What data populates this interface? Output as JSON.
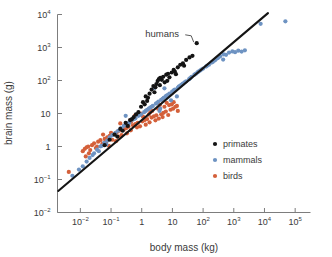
{
  "chart_data": {
    "type": "scatter",
    "title": "",
    "xlabel": "body mass (kg)",
    "ylabel": "brain mass (g)",
    "xscale": "log",
    "yscale": "log",
    "xlim": [
      0.0018,
      316000
    ],
    "ylim": [
      0.01,
      10000
    ],
    "grid": false,
    "legend_position": "inside-lower-right",
    "xticks": [
      {
        "value": 0.01,
        "label": "10",
        "exp": "−2"
      },
      {
        "value": 0.1,
        "label": "10",
        "exp": "−1"
      },
      {
        "value": 1,
        "label": "1",
        "exp": ""
      },
      {
        "value": 10,
        "label": "10",
        "exp": ""
      },
      {
        "value": 100,
        "label": "10",
        "exp": "2"
      },
      {
        "value": 1000,
        "label": "10",
        "exp": "3"
      },
      {
        "value": 10000,
        "label": "10",
        "exp": "4"
      },
      {
        "value": 100000,
        "label": "10",
        "exp": "5"
      }
    ],
    "yticks": [
      {
        "value": 10000,
        "label": "10",
        "exp": "4"
      },
      {
        "value": 1000,
        "label": "10",
        "exp": "3"
      },
      {
        "value": 100,
        "label": "10",
        "exp": "2"
      },
      {
        "value": 10,
        "label": "10",
        "exp": ""
      },
      {
        "value": 1,
        "label": "1",
        "exp": ""
      },
      {
        "value": 0.1,
        "label": "10",
        "exp": "−1"
      },
      {
        "value": 0.01,
        "label": "10",
        "exp": "−2"
      }
    ],
    "annotations": [
      {
        "text": "humans",
        "target_x": 62,
        "target_y": 1350,
        "label_x": 1.3,
        "label_y": 2600
      }
    ],
    "trend_line": {
      "x0": 0.0019,
      "y0": 0.045,
      "x1": 13000,
      "y1": 11000,
      "color": "#141414"
    },
    "series": [
      {
        "name": "primates",
        "color": "#141414",
        "marker": "circle",
        "size": 2.1,
        "points": [
          [
            0.062,
            1.1
          ],
          [
            0.09,
            1.6
          ],
          [
            0.13,
            2.3
          ],
          [
            0.2,
            3.4
          ],
          [
            0.3,
            5.2
          ],
          [
            0.42,
            6.3
          ],
          [
            0.55,
            7.8
          ],
          [
            0.78,
            11
          ],
          [
            0.95,
            16
          ],
          [
            1.1,
            22
          ],
          [
            1.35,
            33
          ],
          [
            1.5,
            24
          ],
          [
            1.8,
            40
          ],
          [
            2.1,
            53
          ],
          [
            2.4,
            68
          ],
          [
            2.6,
            44
          ],
          [
            3.0,
            78
          ],
          [
            3.3,
            96
          ],
          [
            3.6,
            110
          ],
          [
            4.0,
            120
          ],
          [
            4.5,
            105
          ],
          [
            5.0,
            130
          ],
          [
            5.6,
            88
          ],
          [
            6.3,
            150
          ],
          [
            7.2,
            160
          ],
          [
            8.0,
            125
          ],
          [
            9.5,
            175
          ],
          [
            11,
            210
          ],
          [
            13,
            155
          ],
          [
            15,
            250
          ],
          [
            18,
            300
          ],
          [
            22,
            330
          ],
          [
            28,
            420
          ],
          [
            36,
            500
          ],
          [
            45,
            560
          ],
          [
            62,
            1350
          ],
          [
            0.35,
            4.2
          ],
          [
            0.65,
            9.4
          ],
          [
            2.8,
            62
          ],
          [
            6.8,
            98
          ],
          [
            1.25,
            19
          ],
          [
            3.9,
            72
          ],
          [
            12,
            185
          ],
          [
            24,
            280
          ],
          [
            0.16,
            2.0
          ],
          [
            0.24,
            3.0
          ],
          [
            0.48,
            6.8
          ],
          [
            1.6,
            30
          ]
        ]
      },
      {
        "name": "mammals",
        "color": "#6e93c2",
        "marker": "circle",
        "size": 2.1,
        "points": [
          [
            0.0055,
            0.13
          ],
          [
            0.009,
            0.2
          ],
          [
            0.012,
            0.25
          ],
          [
            0.016,
            0.35
          ],
          [
            0.02,
            0.45
          ],
          [
            0.028,
            0.62
          ],
          [
            0.035,
            0.8
          ],
          [
            0.045,
            1.0
          ],
          [
            0.06,
            1.3
          ],
          [
            0.075,
            1.5
          ],
          [
            0.09,
            1.9
          ],
          [
            0.11,
            2.2
          ],
          [
            0.14,
            2.6
          ],
          [
            0.17,
            3.0
          ],
          [
            0.21,
            3.6
          ],
          [
            0.26,
            4.2
          ],
          [
            0.32,
            4.8
          ],
          [
            0.4,
            5.5
          ],
          [
            0.5,
            6.5
          ],
          [
            0.62,
            7.2
          ],
          [
            0.78,
            8.5
          ],
          [
            0.95,
            9.5
          ],
          [
            1.2,
            11
          ],
          [
            1.5,
            13
          ],
          [
            1.9,
            15
          ],
          [
            2.3,
            17
          ],
          [
            2.9,
            20
          ],
          [
            3.5,
            23
          ],
          [
            4.3,
            26
          ],
          [
            5.2,
            30
          ],
          [
            6.5,
            35
          ],
          [
            8.0,
            40
          ],
          [
            9.8,
            46
          ],
          [
            12,
            53
          ],
          [
            15,
            60
          ],
          [
            18,
            70
          ],
          [
            22,
            80
          ],
          [
            28,
            95
          ],
          [
            35,
            110
          ],
          [
            42,
            130
          ],
          [
            52,
            150
          ],
          [
            65,
            175
          ],
          [
            80,
            200
          ],
          [
            100,
            230
          ],
          [
            125,
            265
          ],
          [
            155,
            300
          ],
          [
            190,
            350
          ],
          [
            230,
            400
          ],
          [
            290,
            470
          ],
          [
            360,
            540
          ],
          [
            450,
            430
          ],
          [
            560,
            600
          ],
          [
            700,
            700
          ],
          [
            900,
            760
          ],
          [
            1100,
            720
          ],
          [
            1400,
            800
          ],
          [
            1800,
            750
          ],
          [
            2300,
            820
          ],
          [
            7500,
            5200
          ],
          [
            48000,
            6200
          ],
          [
            0.04,
            0.72
          ],
          [
            0.07,
            1.15
          ],
          [
            0.13,
            2.4
          ],
          [
            0.22,
            3.3
          ],
          [
            0.38,
            5.0
          ],
          [
            0.58,
            6.9
          ],
          [
            0.88,
            9.0
          ],
          [
            1.35,
            12
          ],
          [
            2.1,
            16
          ],
          [
            3.2,
            21
          ],
          [
            4.8,
            28
          ],
          [
            7.2,
            37
          ],
          [
            11,
            50
          ],
          [
            16,
            65
          ],
          [
            25,
            88
          ],
          [
            38,
            118
          ],
          [
            58,
            160
          ],
          [
            88,
            215
          ],
          [
            135,
            280
          ],
          [
            205,
            365
          ],
          [
            310,
            490
          ],
          [
            470,
            620
          ],
          [
            0.025,
            0.55
          ],
          [
            0.05,
            1.05
          ],
          [
            1.7,
            14
          ],
          [
            6.0,
            33
          ],
          [
            20,
            75
          ],
          [
            70,
            185
          ],
          [
            250,
            420
          ],
          [
            3.8,
            12
          ],
          [
            9.0,
            25
          ],
          [
            0.3,
            8.5
          ],
          [
            2.6,
            60
          ],
          [
            5.5,
            58
          ],
          [
            14,
            33
          ],
          [
            4.0,
            14
          ]
        ]
      },
      {
        "name": "birds",
        "color": "#d4603a",
        "marker": "circle",
        "size": 2.1,
        "points": [
          [
            0.0042,
            0.17
          ],
          [
            0.012,
            0.72
          ],
          [
            0.014,
            0.85
          ],
          [
            0.016,
            0.95
          ],
          [
            0.018,
            1.0
          ],
          [
            0.021,
            0.78
          ],
          [
            0.024,
            1.1
          ],
          [
            0.028,
            1.25
          ],
          [
            0.032,
            0.9
          ],
          [
            0.038,
            1.4
          ],
          [
            0.045,
            1.55
          ],
          [
            0.052,
            1.2
          ],
          [
            0.062,
            1.7
          ],
          [
            0.075,
            1.9
          ],
          [
            0.09,
            2.1
          ],
          [
            0.11,
            1.6
          ],
          [
            0.13,
            2.4
          ],
          [
            0.155,
            2.7
          ],
          [
            0.185,
            3.0
          ],
          [
            0.22,
            2.2
          ],
          [
            0.26,
            3.3
          ],
          [
            0.31,
            3.6
          ],
          [
            0.37,
            4.0
          ],
          [
            0.44,
            3.1
          ],
          [
            0.52,
            4.4
          ],
          [
            0.62,
            4.8
          ],
          [
            0.74,
            5.2
          ],
          [
            0.88,
            4.1
          ],
          [
            1.05,
            5.8
          ],
          [
            1.25,
            6.3
          ],
          [
            1.5,
            6.8
          ],
          [
            1.8,
            5.4
          ],
          [
            2.1,
            7.5
          ],
          [
            2.5,
            8.2
          ],
          [
            3.0,
            8.8
          ],
          [
            3.6,
            7.0
          ],
          [
            4.3,
            9.5
          ],
          [
            5.1,
            10.5
          ],
          [
            6.1,
            11.5
          ],
          [
            7.3,
            9.0
          ],
          [
            8.7,
            13
          ],
          [
            10.5,
            14
          ],
          [
            12.5,
            16
          ],
          [
            15,
            12
          ],
          [
            0.019,
            0.62
          ],
          [
            0.035,
            1.0
          ],
          [
            0.068,
            1.35
          ],
          [
            0.1,
            2.6
          ],
          [
            0.17,
            2.0
          ],
          [
            0.28,
            4.3
          ],
          [
            0.45,
            5.6
          ],
          [
            0.7,
            3.8
          ],
          [
            1.1,
            8.0
          ],
          [
            1.7,
            9.2
          ],
          [
            2.8,
            6.2
          ],
          [
            4.8,
            7.8
          ],
          [
            7.8,
            18
          ],
          [
            2.2,
            12
          ],
          [
            3.4,
            14
          ],
          [
            5.5,
            16
          ],
          [
            0.015,
            0.5
          ],
          [
            0.055,
            2.3
          ],
          [
            0.2,
            5.0
          ],
          [
            0.95,
            10
          ],
          [
            6.5,
            21
          ],
          [
            9.5,
            19
          ],
          [
            1.35,
            4.6
          ],
          [
            0.42,
            6.2
          ],
          [
            0.085,
            1.05
          ],
          [
            0.145,
            1.45
          ],
          [
            0.6,
            8.6
          ],
          [
            3.9,
            18
          ],
          [
            11,
            22
          ],
          [
            0.33,
            2.5
          ],
          [
            1.9,
            11
          ],
          [
            14,
            17
          ]
        ]
      }
    ]
  },
  "legend": {
    "items": [
      {
        "label": "primates",
        "color": "#141414"
      },
      {
        "label": "mammals",
        "color": "#6e93c2"
      },
      {
        "label": "birds",
        "color": "#d4603a"
      }
    ]
  },
  "colors": {
    "primates": "#141414",
    "mammals": "#6e93c2",
    "birds": "#d4603a",
    "axis": "#7d7d7d",
    "text": "#3a3a3a",
    "background": "#ffffff"
  }
}
